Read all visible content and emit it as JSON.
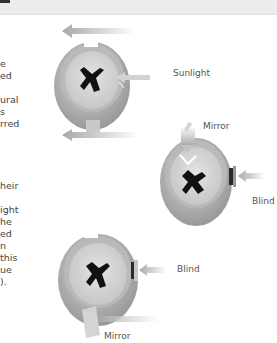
{
  "header": {
    "background": "#ececec"
  },
  "text_fragments": [
    {
      "text": "e",
      "top": 58
    },
    {
      "text": "ed",
      "top": 70
    },
    {
      "text": "ural",
      "top": 94
    },
    {
      "text": "s",
      "top": 106
    },
    {
      "text": "rred",
      "top": 118
    },
    {
      "text": "heir",
      "top": 180
    },
    {
      "text": "ight",
      "top": 204
    },
    {
      "text": "he",
      "top": 216
    },
    {
      "text": "ed",
      "top": 228
    },
    {
      "text": "n",
      "top": 240
    },
    {
      "text": "this",
      "top": 252
    },
    {
      "text": "ue",
      "top": 264
    },
    {
      "text": ").",
      "top": 276
    }
  ],
  "diagrams": {
    "top": {
      "label": "Sunlight"
    },
    "middle": {
      "mirror_label": "Mirror",
      "blind_label": "Blind"
    },
    "bottom": {
      "blind_label": "Blind",
      "mirror_label": "Mirror"
    }
  },
  "colors": {
    "arrow": "#b8b8b8",
    "drum_outer": "#a9a9a9",
    "drum_inner": "#d9d9d9",
    "bird": "#111111",
    "text": "#444444"
  }
}
